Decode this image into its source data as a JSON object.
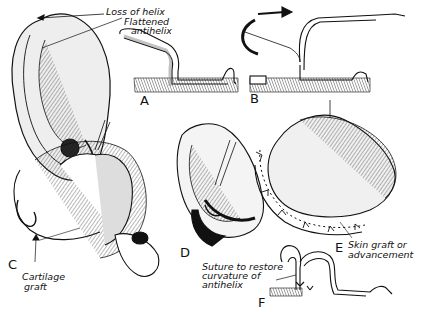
{
  "figure": {
    "type": "surgical illustration",
    "colors": {
      "ink": "#111111",
      "background": "#ffffff",
      "shade": "#c8c8c8"
    }
  },
  "annotations": {
    "loss_of_helix": "Loss of helix",
    "flattened_antihelix_1": "Flattened",
    "flattened_antihelix_2": "antihelix",
    "cartilage_graft_1": "Cartilage",
    "cartilage_graft_2": "graft",
    "skin_graft_1": "Skin graft or",
    "skin_graft_2": "advancement",
    "suture_1": "Suture to restore",
    "suture_2": "curvature of",
    "suture_3": "antihelix"
  },
  "panels": [
    {
      "letter": "A",
      "depicts": "ear with flattened antihelix and cross-section"
    },
    {
      "letter": "B",
      "depicts": "cross-section with curved arrow showing fold"
    },
    {
      "letter": "C",
      "depicts": "cartilage graft insertion"
    },
    {
      "letter": "D",
      "depicts": "ear with incision"
    },
    {
      "letter": "E",
      "depicts": "skin graft or advancement with sutures"
    },
    {
      "letter": "F",
      "depicts": "cross-section with suture restoring antihelix curvature"
    }
  ]
}
